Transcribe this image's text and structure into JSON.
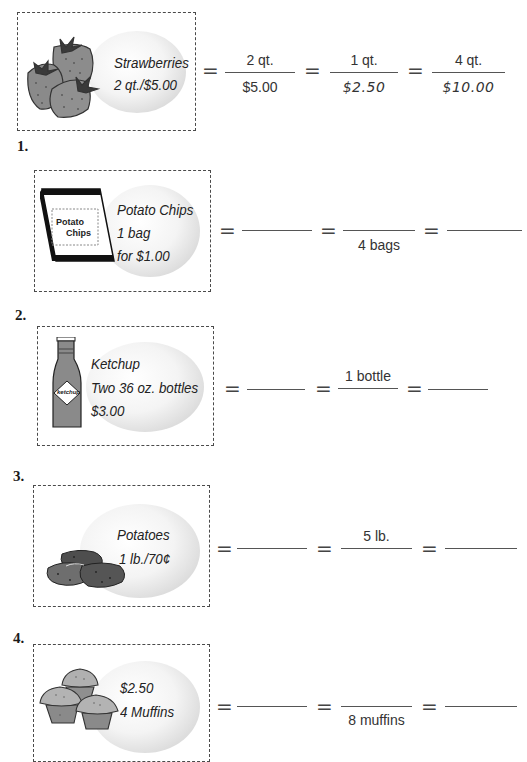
{
  "example": {
    "item_label_line1": "Strawberries",
    "item_label_line2": "2 qt./$5.00",
    "icon": "strawberries-icon",
    "equals_sign": "=",
    "fractions": [
      {
        "numerator": "2 qt.",
        "denominator": "$5.00"
      },
      {
        "numerator": "1 qt.",
        "denominator": "$2.50"
      },
      {
        "numerator": "4 qt.",
        "denominator": "$10.00"
      }
    ]
  },
  "problems": [
    {
      "number": "1.",
      "icon": "potato-chips-bag-icon",
      "package_text_line1": "Potato",
      "package_text_line2": "Chips",
      "label_lines": [
        "Potato Chips",
        "1 bag",
        "for $1.00"
      ],
      "fractions": [
        {
          "numerator": "",
          "denominator": ""
        },
        {
          "numerator": "",
          "denominator": "4 bags"
        },
        {
          "numerator": "",
          "denominator": ""
        }
      ]
    },
    {
      "number": "2.",
      "icon": "ketchup-bottle-icon",
      "package_text_line1": "ketchup",
      "label_lines": [
        "Ketchup",
        "Two 36 oz. bottles",
        "$3.00"
      ],
      "fractions": [
        {
          "numerator": "",
          "denominator": ""
        },
        {
          "numerator": "1 bottle",
          "denominator": ""
        },
        {
          "numerator": "",
          "denominator": ""
        }
      ]
    },
    {
      "number": "3.",
      "icon": "potatoes-icon",
      "label_lines": [
        "Potatoes",
        "1 lb./70¢"
      ],
      "fractions": [
        {
          "numerator": "",
          "denominator": ""
        },
        {
          "numerator": "5 lb.",
          "denominator": ""
        },
        {
          "numerator": "",
          "denominator": ""
        }
      ]
    },
    {
      "number": "4.",
      "icon": "muffins-icon",
      "label_lines": [
        "$2.50",
        "4 Muffins"
      ],
      "fractions": [
        {
          "numerator": "",
          "denominator": ""
        },
        {
          "numerator": "",
          "denominator": "8 muffins"
        },
        {
          "numerator": "",
          "denominator": ""
        }
      ]
    }
  ],
  "equals_sign": "="
}
